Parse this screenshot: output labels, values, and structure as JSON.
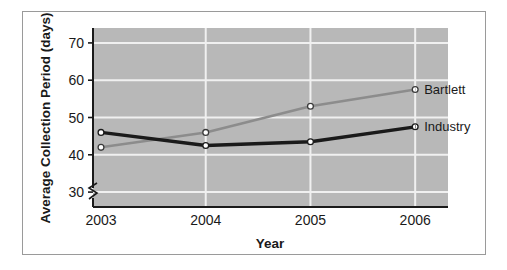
{
  "chart_data": {
    "type": "line",
    "title": "",
    "subtitle": "",
    "xlabel": "Year",
    "ylabel": "Average Collection Period (days)",
    "categories": [
      "2003",
      "2004",
      "2005",
      "2006"
    ],
    "x": [
      2003,
      2004,
      2005,
      2006
    ],
    "series": [
      {
        "name": "Bartlett",
        "values": [
          42,
          46,
          53,
          57.5
        ],
        "color": "#8c8c8c",
        "marker": "open-circle",
        "label_position": "right-end"
      },
      {
        "name": "Industry",
        "values": [
          46,
          42.5,
          43.5,
          47.5
        ],
        "color": "#1a1a1a",
        "marker": "open-circle",
        "label_position": "right-end"
      }
    ],
    "ylim": [
      26,
      74
    ],
    "yticks": [
      30,
      40,
      50,
      60,
      70
    ],
    "ytick_labels": [
      "30",
      "40",
      "50",
      "60",
      "70"
    ],
    "xticks": [
      2003,
      2004,
      2005,
      2006
    ],
    "xtick_labels": [
      "2003",
      "2004",
      "2005",
      "2006"
    ],
    "axis_break": true,
    "axis_break_note": "zigzag break on y-axis below 30",
    "grid": true,
    "grid_orientation": "both",
    "grid_color": "#f0f0f0",
    "plot_background": "#b8b8b8",
    "figure_background": "#ffffff",
    "legend": "inline-series-labels",
    "legend_position": "right-of-plot-at-series-end"
  },
  "axis": {
    "ylabel": "Average Collection Period (days)",
    "xlabel": "Year",
    "yticks": [
      "70",
      "60",
      "50",
      "40",
      "30"
    ],
    "xticks": [
      "2003",
      "2004",
      "2005",
      "2006"
    ]
  },
  "labels": {
    "bartlett": "Bartlett",
    "industry": "Industry"
  }
}
